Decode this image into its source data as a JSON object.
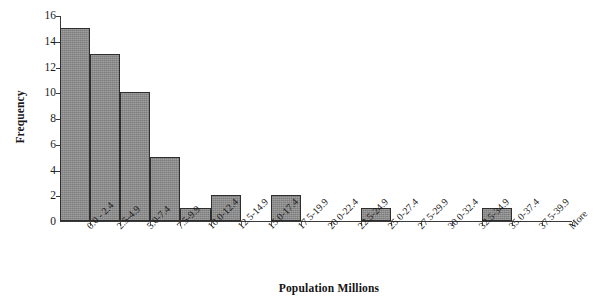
{
  "chart_data": {
    "type": "bar",
    "title": "",
    "subtitle": "",
    "xlabel": "Population Millions",
    "ylabel": "Frequency",
    "categories": [
      "0.0 - 2.4",
      "2.5-4.9",
      "5.0-7.4",
      "7.5-9.9",
      "10.0-12.4",
      "12.5-14.9",
      "15.0-17.4",
      "17.5-19.9",
      "20.0-22.4",
      "22.5-24.9",
      "25.0-27.4",
      "27.5-29.9",
      "30.0-32.4",
      "32.5-34.9",
      "35.0-37.4",
      "37.5-39.9",
      "More"
    ],
    "values": [
      15,
      13,
      10,
      5,
      1,
      2,
      0,
      2,
      0,
      0,
      1,
      0,
      0,
      0,
      1,
      0,
      0
    ],
    "ylim": [
      0,
      16
    ],
    "yticks": [
      0,
      2,
      4,
      6,
      8,
      10,
      12,
      14,
      16
    ],
    "grid": false,
    "legend": false,
    "legend_position": "none",
    "bar_fill_color": "#8c8c8c",
    "bar_border_color": "#2e2e2e",
    "axis_color": "#3a3a3a",
    "text_color": "#1a1a1a",
    "background_color": "#ffffff",
    "bar_gap": "none-adjacent"
  }
}
